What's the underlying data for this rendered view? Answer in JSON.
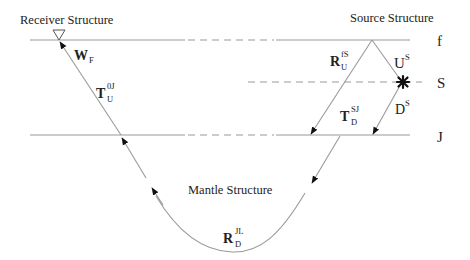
{
  "titles": {
    "receiver": "Receiver Structure",
    "source": "Source Structure",
    "mantle": "Mantle Structure"
  },
  "levels": {
    "f": "f",
    "s": "S",
    "j": "J"
  },
  "operators": {
    "wf": {
      "base": "W",
      "sub": "F",
      "sup": ""
    },
    "tu0j": {
      "base": "T",
      "sub": "U",
      "sup": "0J"
    },
    "rufs": {
      "base": "R",
      "sub": "U",
      "sup": "fS"
    },
    "us": {
      "base": "U",
      "sub": "",
      "sup": "S"
    },
    "tdsj": {
      "base": "T",
      "sub": "D",
      "sup": "SJ"
    },
    "ds": {
      "base": "D",
      "sub": "",
      "sup": "S"
    },
    "rdjl": {
      "base": "R",
      "sub": "D",
      "sup": "JL"
    }
  },
  "symbols": {
    "receiver": "receiver-triangle",
    "source": "source-star"
  },
  "colors": {
    "line": "#9a9a9a",
    "arrow": "#111111",
    "text": "#222222"
  }
}
